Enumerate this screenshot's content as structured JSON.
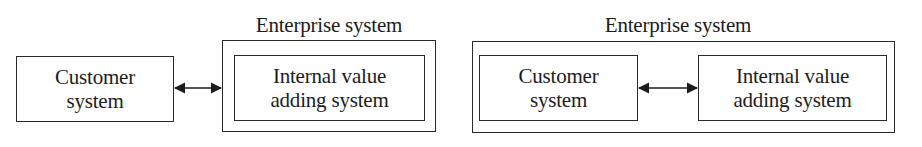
{
  "diagrams": [
    {
      "id": "left",
      "container": {
        "title": "Enterprise system"
      },
      "nodes": [
        {
          "id": "customer",
          "label": "Customer\nsystem",
          "inside_container": false
        },
        {
          "id": "internal",
          "label": "Internal value\nadding system",
          "inside_container": true
        }
      ],
      "edges": [
        {
          "from": "customer",
          "to": "internal",
          "type": "bidirectional-arrow"
        }
      ]
    },
    {
      "id": "right",
      "container": {
        "title": "Enterprise system"
      },
      "nodes": [
        {
          "id": "customer",
          "label": "Customer\nsystem",
          "inside_container": true
        },
        {
          "id": "internal",
          "label": "Internal value\nadding system",
          "inside_container": true
        }
      ],
      "edges": [
        {
          "from": "customer",
          "to": "internal",
          "type": "bidirectional-arrow"
        }
      ]
    }
  ],
  "colors": {
    "stroke": "#2a2a2a",
    "text": "#1c1c1c",
    "background": "#ffffff"
  }
}
